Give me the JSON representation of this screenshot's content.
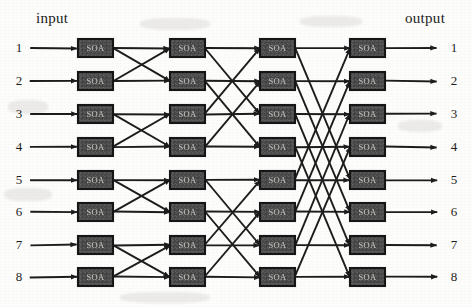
{
  "figure": {
    "type": "diagram",
    "subtype": "multistage-interconnection-network",
    "header_input": "input",
    "header_output": "output",
    "node_label": "SOA",
    "stages": 4,
    "ports": 8,
    "switch_count": 32,
    "colors": {
      "background": "#fdfdfb",
      "node_fill": "#4a4a4a",
      "node_border": "#171717",
      "node_text": "#c9c6c0",
      "line": "#1c1c1c",
      "label_text": "#1d1d1d"
    },
    "input_labels": [
      "1",
      "2",
      "3",
      "4",
      "5",
      "6",
      "7",
      "8"
    ],
    "output_labels": [
      "1",
      "2",
      "3",
      "4",
      "5",
      "6",
      "7",
      "8"
    ],
    "geometry": {
      "row_centers": [
        48,
        81,
        114,
        147,
        180,
        212,
        245,
        277
      ],
      "column_x": [
        78,
        170,
        260,
        350
      ],
      "node_width": 35,
      "node_height": 18,
      "input_arrow_start_x": 30,
      "output_arrow_end_x": 437
    },
    "stage_nodes": [
      {
        "stage": 1,
        "labels": [
          "SOA",
          "SOA",
          "SOA",
          "SOA",
          "SOA",
          "SOA",
          "SOA",
          "SOA"
        ]
      },
      {
        "stage": 2,
        "labels": [
          "SOA",
          "SOA",
          "SOA",
          "SOA",
          "SOA",
          "SOA",
          "SOA",
          "SOA"
        ]
      },
      {
        "stage": 3,
        "labels": [
          "SOA",
          "SOA",
          "SOA",
          "SOA",
          "SOA",
          "SOA",
          "SOA",
          "SOA"
        ]
      },
      {
        "stage": 4,
        "labels": [
          "SOA",
          "SOA",
          "SOA",
          "SOA",
          "SOA",
          "SOA",
          "SOA",
          "SOA"
        ]
      }
    ],
    "links": {
      "stage1_to_stage2_pairs": [
        [
          0,
          0
        ],
        [
          0,
          1
        ],
        [
          1,
          0
        ],
        [
          1,
          1
        ],
        [
          2,
          2
        ],
        [
          2,
          3
        ],
        [
          3,
          2
        ],
        [
          3,
          3
        ],
        [
          4,
          4
        ],
        [
          4,
          5
        ],
        [
          5,
          4
        ],
        [
          5,
          5
        ],
        [
          6,
          6
        ],
        [
          6,
          7
        ],
        [
          7,
          6
        ],
        [
          7,
          7
        ]
      ],
      "stage2_to_stage3_pairs": [
        [
          0,
          0
        ],
        [
          0,
          2
        ],
        [
          1,
          1
        ],
        [
          1,
          3
        ],
        [
          2,
          0
        ],
        [
          2,
          2
        ],
        [
          3,
          1
        ],
        [
          3,
          3
        ],
        [
          4,
          4
        ],
        [
          4,
          6
        ],
        [
          5,
          5
        ],
        [
          5,
          7
        ],
        [
          6,
          4
        ],
        [
          6,
          6
        ],
        [
          7,
          5
        ],
        [
          7,
          7
        ]
      ],
      "stage3_to_stage4_pairs": [
        [
          0,
          0
        ],
        [
          0,
          4
        ],
        [
          1,
          1
        ],
        [
          1,
          5
        ],
        [
          2,
          2
        ],
        [
          2,
          6
        ],
        [
          3,
          3
        ],
        [
          3,
          7
        ],
        [
          4,
          0
        ],
        [
          4,
          4
        ],
        [
          5,
          1
        ],
        [
          5,
          5
        ],
        [
          6,
          2
        ],
        [
          6,
          6
        ],
        [
          7,
          3
        ],
        [
          7,
          7
        ]
      ]
    }
  }
}
